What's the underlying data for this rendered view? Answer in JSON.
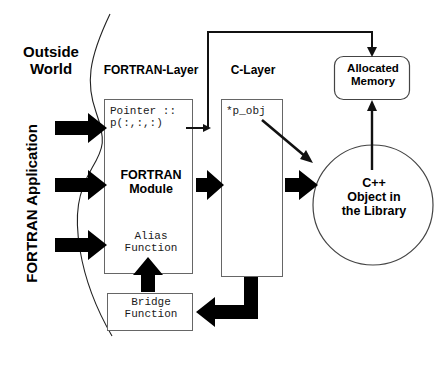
{
  "diagram": {
    "labels": {
      "outside_world": "Outside\nWorld",
      "fortran_application": "FORTRAN Application",
      "fortran_layer": "FORTRAN-Layer",
      "c_layer": "C-Layer",
      "pointer_decl": "Pointer ::\np(:,:,:)",
      "fortran_module": "FORTRAN\nModule",
      "alias_function": "Alias\nFunction",
      "bridge_function": "Bridge\nFunction",
      "p_obj": "*p_obj",
      "allocated_memory": "Allocated\nMemory",
      "cpp_object": "C++\nObject in\nthe Library"
    },
    "colors": {
      "stroke": "#1a1a1a",
      "box_border": "#555555",
      "fill": "#ffffff",
      "arrow_solid": "#000000",
      "background": "#ffffff"
    },
    "nodes": [
      {
        "id": "fortran-layer-box",
        "type": "rect",
        "x": 104,
        "y": 99,
        "w": 89,
        "h": 175
      },
      {
        "id": "c-layer-box",
        "type": "rect",
        "x": 221,
        "y": 99,
        "w": 62,
        "h": 178
      },
      {
        "id": "bridge-function-box",
        "type": "rect",
        "x": 107,
        "y": 293,
        "w": 86,
        "h": 38
      },
      {
        "id": "allocated-memory-box",
        "type": "rounded-rect",
        "x": 334,
        "y": 56,
        "w": 76,
        "h": 44
      },
      {
        "id": "cpp-object-circle",
        "type": "circle",
        "cx": 373,
        "cy": 205,
        "r": 60
      }
    ],
    "connectors": [
      {
        "id": "input-arrow-1",
        "kind": "solid-thick",
        "from": "outside-world",
        "to": "pointer-declaration"
      },
      {
        "id": "input-arrow-2",
        "kind": "solid-thick",
        "from": "outside-world",
        "to": "fortran-module"
      },
      {
        "id": "input-arrow-3",
        "kind": "solid-thick",
        "from": "outside-world",
        "to": "alias-function"
      },
      {
        "id": "module-to-clayer-arrow",
        "kind": "solid-thick",
        "from": "fortran-module",
        "to": "c-layer"
      },
      {
        "id": "clayer-to-cpp-arrow",
        "kind": "solid-thick",
        "from": "c-layer",
        "to": "cpp-object-circle"
      },
      {
        "id": "pointer-to-allocated-memory-line",
        "kind": "thin-routed",
        "from": "pointer-declaration",
        "to": "allocated-memory-box"
      },
      {
        "id": "pobj-to-cpp-arrow",
        "kind": "thin-diagonal",
        "from": "p_obj",
        "to": "cpp-object-circle"
      },
      {
        "id": "cpp-to-allocated-memory-arrow",
        "kind": "thin-vertical",
        "from": "cpp-object-circle",
        "to": "allocated-memory-box"
      },
      {
        "id": "clayer-to-bridge-arrow",
        "kind": "solid-thick-routed",
        "from": "c-layer",
        "to": "bridge-function-box"
      },
      {
        "id": "bridge-to-alias-arrow",
        "kind": "solid-thick-up",
        "from": "bridge-function-box",
        "to": "alias-function"
      },
      {
        "id": "boundary-curve",
        "kind": "thin-curve",
        "from": "top",
        "to": "bottom"
      }
    ]
  }
}
